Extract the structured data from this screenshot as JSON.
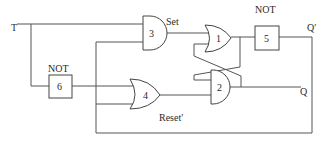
{
  "diagram": {
    "type": "logic-circuit",
    "input_label": "T",
    "labels": {
      "set": "Set",
      "reset": "Reset′",
      "not_top": "NOT",
      "not_left": "NOT",
      "q": "Q",
      "q_prime": "Q′"
    },
    "gates": [
      {
        "id": "1",
        "type": "OR",
        "label": "1"
      },
      {
        "id": "2",
        "type": "AND",
        "label": "2"
      },
      {
        "id": "3",
        "type": "AND",
        "label": "3"
      },
      {
        "id": "4",
        "type": "OR",
        "label": "4"
      },
      {
        "id": "5",
        "type": "NOT",
        "label": "5"
      },
      {
        "id": "6",
        "type": "NOT",
        "label": "6"
      }
    ],
    "colors": {
      "wire": "#555555",
      "text": "#2a2a2a",
      "background": "#ffffff"
    }
  }
}
